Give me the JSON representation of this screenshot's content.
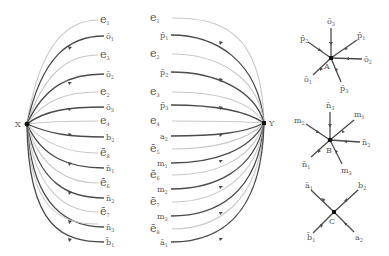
{
  "diagram": {
    "left_bundle": {
      "source_vertex": "X",
      "edges": [
        {
          "label": "e",
          "sub": "1",
          "bar": false,
          "style": "light",
          "y": 20
        },
        {
          "label": "o",
          "sub": "1",
          "bar": true,
          "style": "dark",
          "y": 36
        },
        {
          "label": "e",
          "sub": "3",
          "bar": false,
          "style": "light",
          "y": 55
        },
        {
          "label": "o",
          "sub": "2",
          "bar": true,
          "style": "dark",
          "y": 74
        },
        {
          "label": "e",
          "sub": "2",
          "bar": false,
          "style": "light",
          "y": 92
        },
        {
          "label": "o",
          "sub": "3",
          "bar": true,
          "style": "dark",
          "y": 107
        },
        {
          "label": "e",
          "sub": "4",
          "bar": false,
          "style": "light",
          "y": 121
        },
        {
          "label": "b",
          "sub": "2",
          "bar": false,
          "style": "dark",
          "y": 137
        },
        {
          "label": "e",
          "sub": "8",
          "bar": true,
          "style": "light",
          "y": 153
        },
        {
          "label": "n",
          "sub": "1",
          "bar": true,
          "style": "dark",
          "y": 168
        },
        {
          "label": "e",
          "sub": "6",
          "bar": true,
          "style": "light",
          "y": 183
        },
        {
          "label": "n",
          "sub": "2",
          "bar": true,
          "style": "dark",
          "y": 198
        },
        {
          "label": "e",
          "sub": "7",
          "bar": true,
          "style": "light",
          "y": 212
        },
        {
          "label": "n",
          "sub": "3",
          "bar": true,
          "style": "dark",
          "y": 227
        },
        {
          "label": "e",
          "sub": "5",
          "bar": true,
          "style": "light",
          "y": 224
        },
        {
          "label": "b",
          "sub": "1",
          "bar": true,
          "style": "dark",
          "y": 242
        }
      ]
    },
    "right_bundle": {
      "target_vertex": "Y",
      "edges": [
        {
          "label": "e",
          "sub": "1",
          "bar": false,
          "style": "light",
          "y": 18
        },
        {
          "label": "p",
          "sub": "1",
          "bar": true,
          "style": "dark",
          "y": 35
        },
        {
          "label": "e",
          "sub": "2",
          "bar": false,
          "style": "light",
          "y": 54
        },
        {
          "label": "p",
          "sub": "2",
          "bar": true,
          "style": "dark",
          "y": 72
        },
        {
          "label": "e",
          "sub": "3",
          "bar": false,
          "style": "light",
          "y": 92
        },
        {
          "label": "p",
          "sub": "3",
          "bar": true,
          "style": "dark",
          "y": 105
        },
        {
          "label": "e",
          "sub": "4",
          "bar": false,
          "style": "light",
          "y": 121
        },
        {
          "label": "a",
          "sub": "2",
          "bar": false,
          "style": "dark",
          "y": 136
        },
        {
          "label": "e",
          "sub": "5",
          "bar": true,
          "style": "light",
          "y": 149
        },
        {
          "label": "m",
          "sub": "1",
          "bar": false,
          "style": "dark",
          "y": 163
        },
        {
          "label": "e",
          "sub": "6",
          "bar": true,
          "style": "light",
          "y": 175
        },
        {
          "label": "m",
          "sub": "2",
          "bar": false,
          "style": "dark",
          "y": 189
        },
        {
          "label": "e",
          "sub": "7",
          "bar": true,
          "style": "light",
          "y": 202
        },
        {
          "label": "m",
          "sub": "3",
          "bar": false,
          "style": "dark",
          "y": 216
        },
        {
          "label": "e",
          "sub": "8",
          "bar": true,
          "style": "light",
          "y": 229
        },
        {
          "label": "a",
          "sub": "1",
          "bar": true,
          "style": "dark",
          "y": 242
        }
      ]
    },
    "vertex_A": {
      "name": "A",
      "spokes": [
        "o3 (bar, top)",
        "p1 (bar, upper-right)",
        "o2 (bar, right)",
        "p3 (bar, lower-right)",
        "o1 (bar, lower-left)",
        "p2 (bar, upper-left)"
      ]
    },
    "vertex_B": {
      "name": "B",
      "spokes": [
        "n3 (bar, top)",
        "m1 (upper-right)",
        "n2 (bar, right)",
        "m3 (lower-right)",
        "n1 (bar, lower-left)",
        "m2 (upper-left)"
      ]
    },
    "vertex_C": {
      "name": "C",
      "spokes": [
        "a1 (bar, upper-left)",
        "b2 (upper-right)",
        "a2 (lower-right)",
        "b1 (bar, lower-left)"
      ]
    },
    "labels": {
      "X": "X",
      "Y": "Y",
      "A": "A",
      "B": "B",
      "C": "C"
    }
  }
}
